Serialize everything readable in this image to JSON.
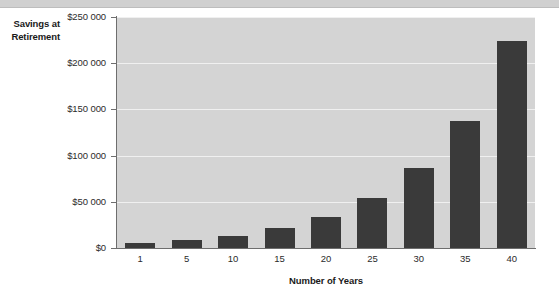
{
  "chart_data": {
    "type": "bar",
    "title": "",
    "subtitle": "",
    "xlabel": "Number of Years",
    "ylabel": "Savings at Retirement",
    "categories": [
      "1",
      "5",
      "10",
      "15",
      "20",
      "25",
      "30",
      "35",
      "40"
    ],
    "values": [
      5500,
      9000,
      13500,
      22000,
      34000,
      54000,
      87000,
      138000,
      224000
    ],
    "ylim": [
      0,
      250000
    ],
    "yticks": [
      0,
      50000,
      100000,
      150000,
      200000,
      250000
    ],
    "ytick_labels": [
      "$0",
      "$50 000",
      "$100 000",
      "$150 000",
      "$200 000",
      "$250 000"
    ],
    "grid": true,
    "legend": false,
    "legend_position": "none",
    "colors": {
      "bar": "#3a3a3a",
      "plot_background": "#d4d4d4",
      "gridline": "#f0f0f0",
      "axis": "#6e6e6e",
      "text": "#1a1a1a",
      "top_band": "#d0d0d0"
    }
  },
  "axis": {
    "y_title_line1": "Savings at",
    "y_title_line2": "Retirement"
  }
}
